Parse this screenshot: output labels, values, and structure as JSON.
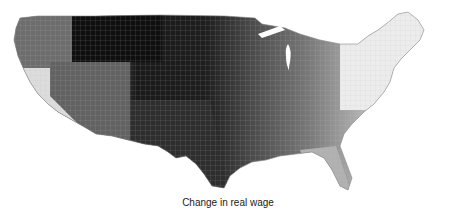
{
  "map": {
    "title": "",
    "region": "Contiguous United States (counties)",
    "caption": "Change in real wage",
    "color_scale": "grayscale (dark = larger change, light = smaller change)",
    "colors": {
      "darkest": "#111111",
      "dark": "#3a3a3a",
      "mid": "#6a6a6a",
      "light": "#a8a8a8",
      "lightest": "#e6e6e6",
      "borders": "#cfcfcf"
    },
    "regions": [
      {
        "name": "Northern Plains",
        "shade": "darkest"
      },
      {
        "name": "Southern Plains / Texas",
        "shade": "dark"
      },
      {
        "name": "Mountain West",
        "shade": "mid"
      },
      {
        "name": "Pacific Northwest",
        "shade": "mid"
      },
      {
        "name": "California",
        "shade": "lightest"
      },
      {
        "name": "Midwest",
        "shade": "mid"
      },
      {
        "name": "Southeast",
        "shade": "light"
      },
      {
        "name": "Northeast",
        "shade": "lightest"
      },
      {
        "name": "Florida",
        "shade": "light"
      }
    ]
  }
}
